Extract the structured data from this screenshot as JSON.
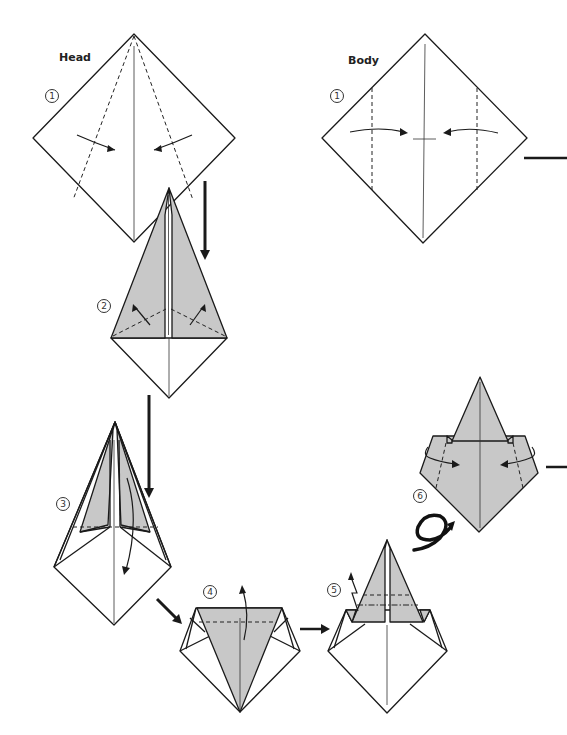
{
  "diagram": {
    "sections": [
      {
        "label": "Head",
        "steps": [
          "1",
          "2",
          "3",
          "4",
          "5",
          "6"
        ]
      },
      {
        "label": "Body",
        "steps": [
          "1"
        ]
      }
    ],
    "head_label": "Head",
    "body_label": "Body",
    "step_markers": {
      "head_1": "1",
      "body_1": "1",
      "step_2": "2",
      "step_3": "3",
      "step_4": "4",
      "step_5": "5",
      "step_6": "6"
    },
    "colors": {
      "paper_colored_side": "#c8c8c8",
      "paper_white_side": "#ffffff",
      "line": "#1a1a1a"
    },
    "symbols": {
      "valley_fold": "dashed-line",
      "mountain_fold": "dash-dot-line",
      "turn_over": "loop-arrow",
      "pleat": "zigzag-arrow"
    }
  }
}
